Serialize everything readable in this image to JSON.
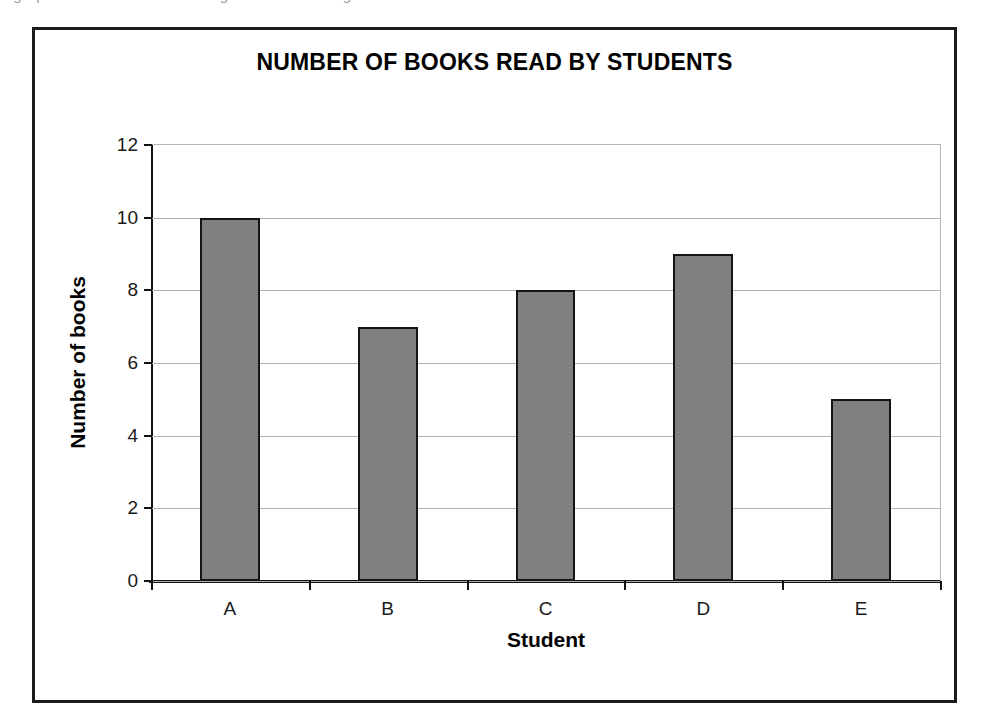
{
  "page": {
    "scan_remnant_text": "a graph on the axes below using the information given"
  },
  "chart_data": {
    "type": "bar",
    "title": "NUMBER OF BOOKS READ BY STUDENTS",
    "xlabel": "Student",
    "ylabel": "Number of books",
    "categories": [
      "A",
      "B",
      "C",
      "D",
      "E"
    ],
    "values": [
      10,
      7,
      8,
      9,
      5
    ],
    "ylim": [
      0,
      12
    ],
    "ytick_labels": [
      "0",
      "2",
      "4",
      "6",
      "8",
      "10",
      "12"
    ],
    "ytick_values": [
      0,
      2,
      4,
      6,
      8,
      10,
      12
    ],
    "grid": true,
    "legend": "none",
    "bar_fill_color": "#808080",
    "bar_border_color": "#151515",
    "gridline_color": "#b0b0b0",
    "axis_color": "#121212",
    "frame_border_color": "#1b1b1b"
  }
}
